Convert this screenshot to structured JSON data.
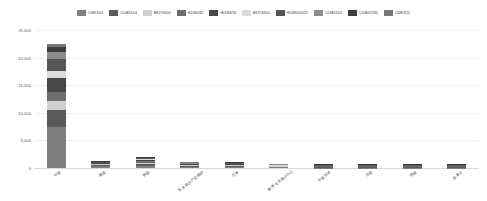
{
  "chart_data": {
    "type": "bar",
    "stacked": true,
    "title": "",
    "subtitle": "",
    "xlabel": "",
    "ylabel": "",
    "ylim": [
      0,
      25000
    ],
    "ytick_labels": [
      "0",
      "5,000",
      "10,000",
      "15,000",
      "20,000",
      "25,000"
    ],
    "ytick_values": [
      0,
      5000,
      10000,
      15000,
      20000,
      25000
    ],
    "grid": true,
    "legend_position": "top",
    "categories": [
      "中国",
      "美国",
      "韩国",
      "世界知识产权组织",
      "日本",
      "欧洲专利局(EPO)",
      "中国台湾",
      "印度",
      "德国",
      "加拿大"
    ],
    "series": [
      {
        "name": "C08K3/04",
        "color": "#7f7f7f",
        "values": [
          7400,
          320,
          430,
          200,
          210,
          130,
          60,
          30,
          25,
          12
        ]
      },
      {
        "name": "C01B31/04",
        "color": "#5a5a5a",
        "values": [
          3100,
          190,
          300,
          150,
          160,
          95,
          40,
          22,
          18,
          9
        ]
      },
      {
        "name": "B82Y30/00",
        "color": "#cfcfcf",
        "values": [
          1700,
          150,
          260,
          120,
          130,
          80,
          32,
          18,
          14,
          7
        ]
      },
      {
        "name": "H01M4/62",
        "color": "#6e6e6e",
        "values": [
          1500,
          130,
          230,
          105,
          115,
          70,
          28,
          15,
          12,
          6
        ]
      },
      {
        "name": "H01M4/36",
        "color": "#474747",
        "values": [
          2600,
          120,
          210,
          95,
          100,
          62,
          25,
          13,
          11,
          5
        ]
      },
      {
        "name": "B82Y40/00",
        "color": "#dcdcdc",
        "values": [
          1200,
          95,
          170,
          80,
          85,
          52,
          20,
          11,
          9,
          4
        ]
      },
      {
        "name": "H01M10/0525",
        "color": "#555555",
        "values": [
          2200,
          85,
          150,
          72,
          76,
          46,
          18,
          10,
          8,
          4
        ]
      },
      {
        "name": "C01B31/02",
        "color": "#8c8c8c",
        "values": [
          1250,
          70,
          130,
          62,
          65,
          40,
          16,
          9,
          7,
          3
        ]
      },
      {
        "name": "C01B32/184",
        "color": "#3d3d3d",
        "values": [
          900,
          60,
          110,
          54,
          56,
          34,
          14,
          8,
          6,
          3
        ]
      },
      {
        "name": "C08K3/22",
        "color": "#777777",
        "values": [
          650,
          50,
          95,
          46,
          48,
          29,
          12,
          7,
          5,
          2
        ]
      }
    ]
  }
}
